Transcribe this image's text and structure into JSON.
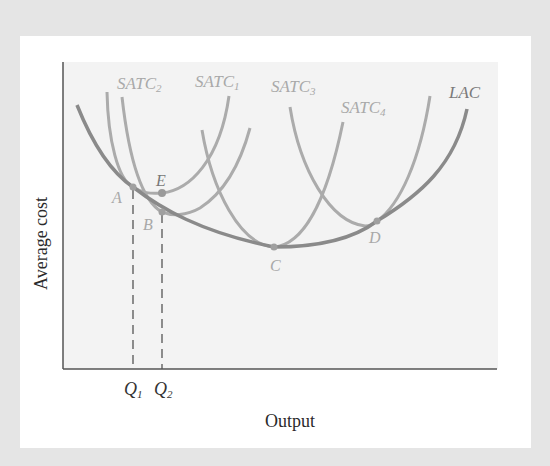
{
  "chart_data": {
    "type": "line",
    "title": "",
    "xlabel": "Output",
    "ylabel": "Average cost",
    "x_ticks": [
      "Q1",
      "Q2"
    ],
    "grid": false,
    "legend": "inline curve labels",
    "series": [
      {
        "name": "LAC",
        "label": "LAC",
        "description": "Long-run average cost (U-shaped envelope)",
        "color": "#8a8a8a"
      },
      {
        "name": "SATC1",
        "label": "SATC",
        "sub": "1",
        "description": "Short-run ATC tangent to LAC at A",
        "color": "#ababab"
      },
      {
        "name": "SATC2",
        "label": "SATC",
        "sub": "2",
        "description": "Short-run ATC tangent to LAC at B",
        "color": "#ababab"
      },
      {
        "name": "SATC3",
        "label": "SATC",
        "sub": "3",
        "description": "Short-run ATC tangent to LAC at C (minimum)",
        "color": "#ababab"
      },
      {
        "name": "SATC4",
        "label": "SATC",
        "sub": "4",
        "description": "Short-run ATC tangent to LAC at D",
        "color": "#ababab"
      }
    ],
    "points": [
      {
        "label": "A",
        "on": "LAC & SATC1",
        "x": "Q1"
      },
      {
        "label": "B",
        "on": "LAC & SATC2",
        "x": "Q2"
      },
      {
        "label": "C",
        "on": "LAC & SATC3",
        "note": "minimum of LAC"
      },
      {
        "label": "D",
        "on": "LAC & SATC4"
      },
      {
        "label": "E",
        "on": "SATC1",
        "x": "Q2",
        "note": "cost of producing Q2 with plant 1"
      }
    ],
    "guides": [
      {
        "type": "dashed-vertical",
        "at": "Q1",
        "from": "A"
      },
      {
        "type": "dashed-vertical",
        "at": "Q2",
        "from": "B"
      }
    ],
    "paths": {
      "LAC": "M77,105 C95,150 115,175 133,187 C160,208 200,232 274,247 C330,247 360,234 377,221 C420,195 455,165 467,109",
      "SATC1": "M107,92 C108,140 118,180 133,187 C142,193 150,194 162,193 C190,190 220,160 229,96",
      "SATC2": "M122,97 C128,150 140,200 162,212 C172,216 186,216 200,208 C225,192 240,165 250,128",
      "SATC3": "M202,130 C212,190 240,245 274,247 C300,245 325,210 343,122",
      "SATC4": "M290,107 C300,170 330,222 365,226 C372,226 376,222 377,221 C400,205 420,160 430,96"
    }
  },
  "labels": {
    "satc": "SATC",
    "satc2_sub": "2",
    "satc1_sub": "1",
    "satc3_sub": "3",
    "satc4_sub": "4",
    "lac": "LAC",
    "point_a": "A",
    "point_b": "B",
    "point_c": "C",
    "point_d": "D",
    "point_e": "E",
    "q": "Q",
    "q1_sub": "1",
    "q2_sub": "2",
    "x_axis_title": "Output",
    "y_axis_title": "Average cost"
  },
  "colors": {
    "outer_border": "#e5e5e5",
    "panel": "#ffffff",
    "plot_background": "#f3f3f3",
    "axis": "#555555",
    "lac_curve": "#8a8a8a",
    "satc_curve": "#ababab",
    "guide": "#555555"
  }
}
